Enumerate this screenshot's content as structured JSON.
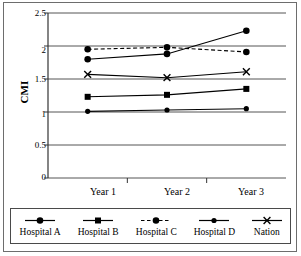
{
  "chart_data": {
    "type": "line",
    "title": "",
    "xlabel": "",
    "ylabel": "CMI",
    "categories": [
      "Year 1",
      "Year 2",
      "Year 3"
    ],
    "ylim": [
      0,
      2.5
    ],
    "ytick_labels": [
      "0",
      "0.5",
      "1",
      "1.5",
      "2",
      "2.5"
    ],
    "ytick_values": [
      0,
      0.5,
      1,
      1.5,
      2,
      2.5
    ],
    "grid": true,
    "legend_position": "bottom",
    "series": [
      {
        "name": "Hospital A",
        "values": [
          1.8,
          1.88,
          2.23
        ],
        "marker": "circle",
        "line_style": "solid",
        "color": "#000000"
      },
      {
        "name": "Hospital B",
        "values": [
          1.23,
          1.26,
          1.35
        ],
        "marker": "square",
        "line_style": "solid",
        "color": "#000000"
      },
      {
        "name": "Hospital C",
        "values": [
          1.95,
          1.98,
          1.91
        ],
        "marker": "circle",
        "line_style": "dashed",
        "color": "#000000"
      },
      {
        "name": "Hospital D",
        "values": [
          1.01,
          1.03,
          1.05
        ],
        "marker": "circle-small",
        "line_style": "solid",
        "color": "#000000"
      },
      {
        "name": "Nation",
        "values": [
          1.57,
          1.52,
          1.61
        ],
        "marker": "x",
        "line_style": "solid",
        "color": "#000000"
      }
    ]
  },
  "axis": {
    "y_title": "CMI",
    "y_ticks": [
      "2.5",
      "2",
      "1.5",
      "1",
      "0.5",
      "0"
    ],
    "x_ticks": [
      "Year 1",
      "Year 2",
      "Year 3"
    ]
  },
  "legend": {
    "entries": [
      {
        "label": "Hospital A"
      },
      {
        "label": "Hospital B"
      },
      {
        "label": "Hospital C"
      },
      {
        "label": "Hospital D"
      },
      {
        "label": "Nation"
      }
    ]
  },
  "colors": {
    "line": "#000000",
    "grid": "#555555",
    "axis": "#333333",
    "frame": "#6d6d6d",
    "background": "#ffffff"
  }
}
